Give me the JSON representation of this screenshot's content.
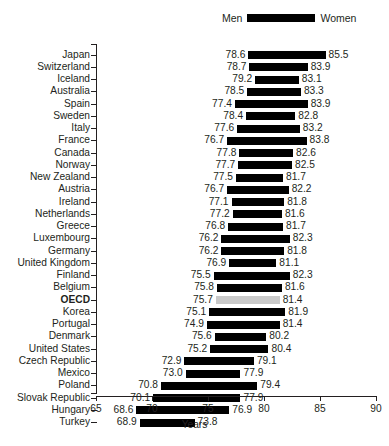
{
  "legend": {
    "men_label": "Men",
    "women_label": "Women",
    "swatch_color": "#000000"
  },
  "axis": {
    "xlabel": "Years",
    "ticks": [
      "65",
      "70",
      "75",
      "80",
      "85",
      "90"
    ]
  },
  "highlight": {
    "row": "OECD",
    "color": "#c9c9c9"
  },
  "chart_data": {
    "type": "bar",
    "orientation": "horizontal",
    "style": "range-bar (dumbbell/floating bar)",
    "title": "",
    "subtitle": "",
    "xlabel": "Years",
    "ylabel": "",
    "xlim": [
      65,
      90
    ],
    "xticks": [
      65,
      70,
      75,
      80,
      85,
      90
    ],
    "grid": false,
    "legend_position": "top-right",
    "legend": [
      "Men",
      "Women"
    ],
    "series": [
      {
        "name": "Men",
        "values": [
          78.6,
          78.7,
          79.2,
          78.5,
          77.4,
          78.4,
          77.6,
          76.7,
          77.8,
          77.7,
          77.5,
          76.7,
          77.1,
          77.2,
          76.8,
          76.2,
          76.2,
          76.9,
          75.5,
          75.8,
          75.7,
          75.1,
          74.9,
          75.6,
          75.2,
          72.9,
          73.0,
          70.8,
          70.1,
          68.6,
          68.9
        ]
      },
      {
        "name": "Women",
        "values": [
          85.5,
          83.9,
          83.1,
          83.3,
          83.9,
          82.8,
          83.2,
          83.8,
          82.6,
          82.5,
          81.7,
          82.2,
          81.8,
          81.6,
          81.7,
          82.3,
          81.8,
          81.1,
          82.3,
          81.6,
          81.4,
          81.9,
          81.4,
          80.2,
          80.4,
          79.1,
          77.9,
          79.4,
          77.9,
          76.9,
          73.8
        ]
      }
    ],
    "categories": [
      "Japan",
      "Switzerland",
      "Iceland",
      "Australia",
      "Spain",
      "Sweden",
      "Italy",
      "France",
      "Canada",
      "Norway",
      "New Zealand",
      "Austria",
      "Ireland",
      "Netherlands",
      "Greece",
      "Luxembourg",
      "Germany",
      "United Kingdom",
      "Finland",
      "Belgium",
      "OECD",
      "Korea",
      "Portugal",
      "Denmark",
      "United States",
      "Czech Republic",
      "Mexico",
      "Poland",
      "Slovak Republic",
      "Hungary",
      "Turkey"
    ]
  },
  "rows": [
    {
      "label": "Japan",
      "men": "78.6",
      "women": "85.5",
      "men_v": 78.6,
      "women_v": 85.5,
      "highlight": false
    },
    {
      "label": "Switzerland",
      "men": "78.7",
      "women": "83.9",
      "men_v": 78.7,
      "women_v": 83.9,
      "highlight": false
    },
    {
      "label": "Iceland",
      "men": "79.2",
      "women": "83.1",
      "men_v": 79.2,
      "women_v": 83.1,
      "highlight": false
    },
    {
      "label": "Australia",
      "men": "78.5",
      "women": "83.3",
      "men_v": 78.5,
      "women_v": 83.3,
      "highlight": false
    },
    {
      "label": "Spain",
      "men": "77.4",
      "women": "83.9",
      "men_v": 77.4,
      "women_v": 83.9,
      "highlight": false
    },
    {
      "label": "Sweden",
      "men": "78.4",
      "women": "82.8",
      "men_v": 78.4,
      "women_v": 82.8,
      "highlight": false
    },
    {
      "label": "Italy",
      "men": "77.6",
      "women": "83.2",
      "men_v": 77.6,
      "women_v": 83.2,
      "highlight": false
    },
    {
      "label": "France",
      "men": "76.7",
      "women": "83.8",
      "men_v": 76.7,
      "women_v": 83.8,
      "highlight": false
    },
    {
      "label": "Canada",
      "men": "77.8",
      "women": "82.6",
      "men_v": 77.8,
      "women_v": 82.6,
      "highlight": false
    },
    {
      "label": "Norway",
      "men": "77.7",
      "women": "82.5",
      "men_v": 77.7,
      "women_v": 82.5,
      "highlight": false
    },
    {
      "label": "New Zealand",
      "men": "77.5",
      "women": "81.7",
      "men_v": 77.5,
      "women_v": 81.7,
      "highlight": false
    },
    {
      "label": "Austria",
      "men": "76.7",
      "women": "82.2",
      "men_v": 76.7,
      "women_v": 82.2,
      "highlight": false
    },
    {
      "label": "Ireland",
      "men": "77.1",
      "women": "81.8",
      "men_v": 77.1,
      "women_v": 81.8,
      "highlight": false
    },
    {
      "label": "Netherlands",
      "men": "77.2",
      "women": "81.6",
      "men_v": 77.2,
      "women_v": 81.6,
      "highlight": false
    },
    {
      "label": "Greece",
      "men": "76.8",
      "women": "81.7",
      "men_v": 76.8,
      "women_v": 81.7,
      "highlight": false
    },
    {
      "label": "Luxembourg",
      "men": "76.2",
      "women": "82.3",
      "men_v": 76.2,
      "women_v": 82.3,
      "highlight": false
    },
    {
      "label": "Germany",
      "men": "76.2",
      "women": "81.8",
      "men_v": 76.2,
      "women_v": 81.8,
      "highlight": false
    },
    {
      "label": "United Kingdom",
      "men": "76.9",
      "women": "81.1",
      "men_v": 76.9,
      "women_v": 81.1,
      "highlight": false
    },
    {
      "label": "Finland",
      "men": "75.5",
      "women": "82.3",
      "men_v": 75.5,
      "women_v": 82.3,
      "highlight": false
    },
    {
      "label": "Belgium",
      "men": "75.8",
      "women": "81.6",
      "men_v": 75.8,
      "women_v": 81.6,
      "highlight": false
    },
    {
      "label": "OECD",
      "men": "75.7",
      "women": "81.4",
      "men_v": 75.7,
      "women_v": 81.4,
      "highlight": true
    },
    {
      "label": "Korea",
      "men": "75.1",
      "women": "81.9",
      "men_v": 75.1,
      "women_v": 81.9,
      "highlight": false
    },
    {
      "label": "Portugal",
      "men": "74.9",
      "women": "81.4",
      "men_v": 74.9,
      "women_v": 81.4,
      "highlight": false
    },
    {
      "label": "Denmark",
      "men": "75.6",
      "women": "80.2",
      "men_v": 75.6,
      "women_v": 80.2,
      "highlight": false
    },
    {
      "label": "United States",
      "men": "75.2",
      "women": "80.4",
      "men_v": 75.2,
      "women_v": 80.4,
      "highlight": false
    },
    {
      "label": "Czech Republic",
      "men": "72.9",
      "women": "79.1",
      "men_v": 72.9,
      "women_v": 79.1,
      "highlight": false
    },
    {
      "label": "Mexico",
      "men": "73.0",
      "women": "77.9",
      "men_v": 73.0,
      "women_v": 77.9,
      "highlight": false
    },
    {
      "label": "Poland",
      "men": "70.8",
      "women": "79.4",
      "men_v": 70.8,
      "women_v": 79.4,
      "highlight": false
    },
    {
      "label": "Slovak Republic",
      "men": "70.1",
      "women": "77.9",
      "men_v": 70.1,
      "women_v": 77.9,
      "highlight": false
    },
    {
      "label": "Hungary",
      "men": "68.6",
      "women": "76.9",
      "men_v": 68.6,
      "women_v": 76.9,
      "highlight": false
    },
    {
      "label": "Turkey",
      "men": "68.9",
      "women": "73.8",
      "men_v": 68.9,
      "women_v": 73.8,
      "highlight": false
    }
  ]
}
